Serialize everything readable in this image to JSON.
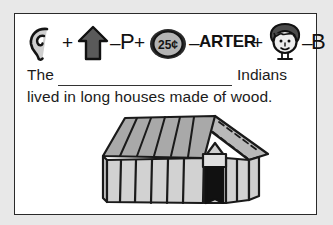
{
  "page": {
    "background_color": "#e8e8e8",
    "card_background": "#ffffff",
    "border_color": "#2a2a2a",
    "ink_color": "#111111"
  },
  "rebus": {
    "description": "Picture-word rebus puzzle equation",
    "elements": [
      {
        "kind": "picture",
        "icon": "ear-icon",
        "label": "ear"
      },
      {
        "kind": "operator",
        "symbol": "+"
      },
      {
        "kind": "picture",
        "icon": "up-arrow-icon",
        "label": "up"
      },
      {
        "kind": "operator",
        "symbol": "–"
      },
      {
        "kind": "letter",
        "symbol": "P"
      },
      {
        "kind": "operator",
        "symbol": "+"
      },
      {
        "kind": "picture",
        "icon": "quarter-coin-icon",
        "label": "quarter",
        "coin_text": "25¢"
      },
      {
        "kind": "operator",
        "symbol": "–"
      },
      {
        "kind": "word",
        "symbol": "ARTER"
      },
      {
        "kind": "operator",
        "symbol": "+"
      },
      {
        "kind": "picture",
        "icon": "boy-face-icon",
        "label": "boy"
      },
      {
        "kind": "operator",
        "symbol": "–"
      },
      {
        "kind": "letter",
        "symbol": "B"
      }
    ],
    "coin_value": "25¢",
    "minus_p": "P",
    "minus_arter": "ARTER",
    "minus_b": "B",
    "plus_sign": "+",
    "minus_sign": "–"
  },
  "sentence": {
    "line_one_prefix": "The",
    "blank_answer": "",
    "line_one_suffix": "Indians",
    "line_two": "lived in long houses made of wood."
  },
  "illustration": {
    "name": "longhouse",
    "caption": "",
    "roof_color": "#a9a9a9",
    "wall_color": "#d2d2d2",
    "door_color": "#111111",
    "outline_color": "#1a1a1a"
  }
}
